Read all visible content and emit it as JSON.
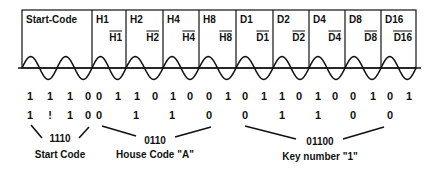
{
  "cells": [
    {
      "id": "start",
      "label": "Start-Code",
      "complement": "",
      "cycles": 2
    },
    {
      "id": "h1",
      "label": "H1",
      "complement": "H1",
      "cycles": 1
    },
    {
      "id": "h2",
      "label": "H2",
      "complement": "H2",
      "cycles": 1
    },
    {
      "id": "h4",
      "label": "H4",
      "complement": "H4",
      "cycles": 1
    },
    {
      "id": "h8",
      "label": "H8",
      "complement": "H8",
      "cycles": 1
    },
    {
      "id": "d1",
      "label": "D1",
      "complement": "D1",
      "cycles": 1
    },
    {
      "id": "d2",
      "label": "D2",
      "complement": "D2",
      "cycles": 1
    },
    {
      "id": "d4",
      "label": "D4",
      "complement": "D4",
      "cycles": 1
    },
    {
      "id": "d8",
      "label": "D8",
      "complement": "D8",
      "cycles": 1
    },
    {
      "id": "d16",
      "label": "D16",
      "complement": "D16",
      "cycles": 1
    }
  ],
  "raw_bits": [
    "1",
    "1",
    "1",
    "0",
    "0",
    "1",
    "1",
    "0",
    "1",
    "0",
    "0",
    "1",
    "0",
    "1",
    "1",
    "0",
    "1",
    "0",
    "0",
    "1",
    "0",
    "1"
  ],
  "decoded_bits": {
    "start": [
      "1",
      "!",
      "1",
      "0"
    ],
    "house": [
      "0",
      "1",
      "1",
      "0"
    ],
    "key": [
      "0",
      "1",
      "1",
      "0",
      "0"
    ]
  },
  "groups": [
    {
      "id": "start",
      "code": "1110",
      "caption": "Start Code"
    },
    {
      "id": "house",
      "code": "0110",
      "caption": "House Code \"A\""
    },
    {
      "id": "key",
      "code": "01100",
      "caption": "Key number \"1\""
    }
  ]
}
